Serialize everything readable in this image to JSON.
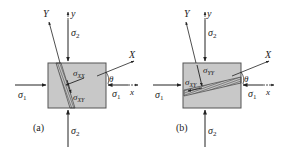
{
  "figure": {
    "panels": [
      {
        "id": "a",
        "caption": "(a)",
        "labels": {
          "sigma1_left": "σ",
          "sigma1_left_sub": "1",
          "sigma1_right": "σ",
          "sigma1_right_sub": "1",
          "sigma2_top": "σ",
          "sigma2_top_sub": "2",
          "sigma2_bottom": "σ",
          "sigma2_bottom_sub": "2",
          "axis_y": "y",
          "axis_x": "x",
          "axis_Y": "Y",
          "axis_X": "X",
          "angle": "θ",
          "stress_normal": "σ",
          "stress_normal_sub": "XX",
          "stress_shear": "σ",
          "stress_shear_sub": "XY"
        }
      },
      {
        "id": "b",
        "caption": "(b)",
        "labels": {
          "sigma1_left": "σ",
          "sigma1_left_sub": "1",
          "sigma1_right": "σ",
          "sigma1_right_sub": "1",
          "sigma2_top": "σ",
          "sigma2_top_sub": "2",
          "sigma2_bottom": "σ",
          "sigma2_bottom_sub": "2",
          "axis_y": "y",
          "axis_x": "x",
          "axis_Y": "Y",
          "axis_X": "X",
          "angle": "θ",
          "stress_normal": "σ",
          "stress_normal_sub": "YY",
          "stress_shear": "σ",
          "stress_shear_sub": "XY"
        }
      }
    ],
    "colors": {
      "element_fill": "#c8c8c8",
      "element_stroke": "#555555",
      "plane_fill": "#5a5a5a",
      "line": "#222222"
    }
  }
}
